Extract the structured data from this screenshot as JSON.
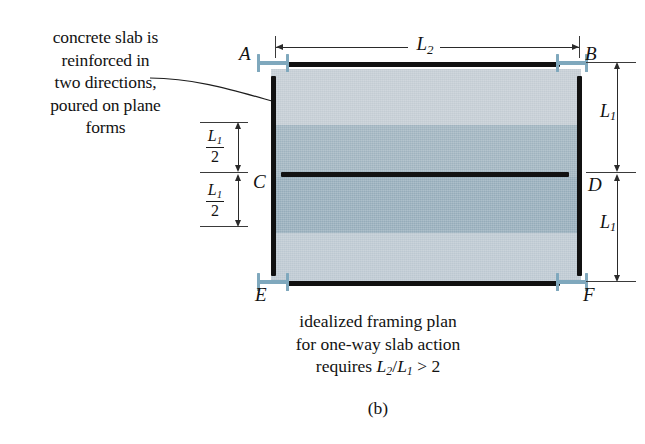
{
  "figure": {
    "label": "(b)",
    "annotation": {
      "lines": [
        "concrete slab is",
        "reinforced in",
        "two directions,",
        "poured on plane",
        "forms"
      ]
    },
    "caption": {
      "line1": "idealized framing plan",
      "line2": "for one-way slab action",
      "line3_prefix": "requires ",
      "line3_ratio_num": "L",
      "line3_ratio_num_sub": "2",
      "line3_slash": "/",
      "line3_ratio_den": "L",
      "line3_ratio_den_sub": "1",
      "line3_suffix": " > 2"
    }
  },
  "joints": {
    "a": "A",
    "b": "B",
    "c": "C",
    "d": "D",
    "e": "E",
    "f": "F"
  },
  "dimensions": {
    "span_horizontal": {
      "symbol": "L",
      "subscript": "2",
      "orientation": "horizontal",
      "position": "top"
    },
    "left_upper": {
      "numerator_symbol": "L",
      "numerator_subscript": "1",
      "denominator": "2"
    },
    "left_lower": {
      "numerator_symbol": "L",
      "numerator_subscript": "1",
      "denominator": "2"
    },
    "right_upper": {
      "symbol": "L",
      "subscript": "1"
    },
    "right_lower": {
      "symbol": "L",
      "subscript": "1"
    }
  },
  "colors": {
    "background": "#ffffff",
    "slab_band_1": "#c3ccd3",
    "slab_band_2": "#9fb3bf",
    "slab_band_3": "#95acba",
    "slab_band_4": "#bcc8d1",
    "beam": "#111111",
    "column_support": "#7fa8bd",
    "dimension_line": "#2a2a2a",
    "text": "#121212"
  }
}
